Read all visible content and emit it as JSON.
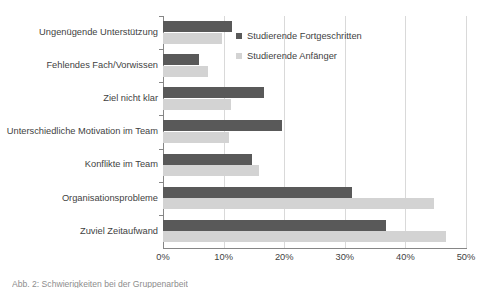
{
  "chart_data": {
    "type": "bar",
    "orientation": "horizontal",
    "title": "",
    "xlabel": "",
    "ylabel": "",
    "xlim": [
      0,
      50
    ],
    "xunit": "%",
    "grid": true,
    "legend_position": "top-right",
    "xticks": [
      "0%",
      "10%",
      "20%",
      "30%",
      "40%",
      "50%"
    ],
    "xtick_values": [
      0,
      10,
      20,
      30,
      40,
      50
    ],
    "categories": [
      "Ungenügende Unterstützung",
      "Fehlendes Fach/Vorwissen",
      "Ziel nicht klar",
      "Unterschiedliche Motivation im Team",
      "Konflikte im Team",
      "Organisationsprobleme",
      "Zuviel Zeitaufwand"
    ],
    "series": [
      {
        "name": "Studierende Fortgeschritten",
        "color": "#595959",
        "values": [
          11.4,
          6.0,
          16.7,
          19.7,
          14.7,
          31.2,
          36.8
        ]
      },
      {
        "name": "Studierende Anfänger",
        "color": "#d3d3d3",
        "values": [
          9.8,
          7.5,
          11.2,
          10.9,
          15.8,
          44.7,
          46.7
        ]
      }
    ]
  },
  "legend": {
    "entries": [
      {
        "label": "Studierende Fortgeschritten"
      },
      {
        "label": "Studierende Anfänger"
      }
    ]
  },
  "caption": {
    "text": "Abb. 2: Schwierigkeiten bei der Gruppenarbeit"
  }
}
